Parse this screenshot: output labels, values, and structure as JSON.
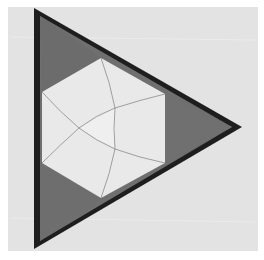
{
  "image": {
    "description": "Photograph of a folded paper triangle with a dark border, three dark gray corner triangles and a light inner hexagon subdivided by thin fold lines",
    "colors": {
      "page_background": "#ffffff",
      "paper": "#e3e3e3",
      "triangle_border": "#1e1e1e",
      "corner_fill": "#6f6f6f",
      "hexagon_fill": "#e9e9e9",
      "center_fill": "#efefef",
      "fold_line": "#8a8a8a"
    },
    "shapes": {
      "outer_triangle": [
        [
          34,
          8
        ],
        [
          242,
          127
        ],
        [
          34,
          249
        ]
      ],
      "inner_triangle": [
        [
          40,
          16
        ],
        [
          232,
          127
        ],
        [
          40,
          241
        ]
      ],
      "corner_top": [
        [
          40,
          16
        ],
        [
          101,
          58
        ],
        [
          42,
          92
        ]
      ],
      "corner_right": [
        [
          165,
          94
        ],
        [
          232,
          127
        ],
        [
          165,
          163
        ]
      ],
      "corner_bottom": [
        [
          42,
          163
        ],
        [
          101,
          198
        ],
        [
          40,
          241
        ]
      ],
      "hexagon": [
        [
          101,
          58
        ],
        [
          165,
          94
        ],
        [
          165,
          163
        ],
        [
          101,
          198
        ],
        [
          42,
          163
        ],
        [
          42,
          92
        ]
      ],
      "center_points": [
        [
          115,
          108
        ],
        [
          79,
          128
        ],
        [
          115,
          149
        ]
      ]
    }
  }
}
